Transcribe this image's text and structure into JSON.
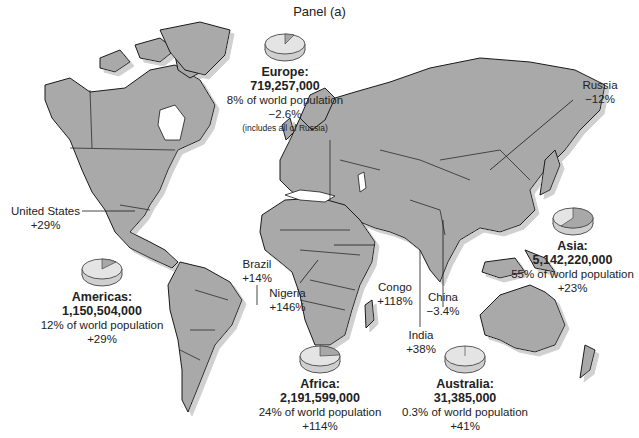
{
  "panel_title": "Panel (a)",
  "colors": {
    "land": "#a9a9a9",
    "border": "#1a1a1a",
    "shadow": "#d8d8d8",
    "water": "#ffffff",
    "pie_top": "#e4e4e4",
    "pie_slice": "#a8a8a8",
    "pie_side": "#cfcfcf"
  },
  "regions": [
    {
      "id": "europe",
      "name": "Europe:",
      "population": "719,257,000",
      "share": "8% of world population",
      "change": "−2.6%",
      "note": "(includes all of Russia)",
      "share_pct": 8
    },
    {
      "id": "asia",
      "name": "Asia:",
      "population": "5,142,220,000",
      "share": "55% of world population",
      "change": "+23%",
      "share_pct": 55
    },
    {
      "id": "americas",
      "name": "Americas:",
      "population": "1,150,504,000",
      "share": "12% of world population",
      "change": "+29%",
      "share_pct": 12
    },
    {
      "id": "africa",
      "name": "Africa:",
      "population": "2,191,599,000",
      "share": "24% of world population",
      "change": "+114%",
      "share_pct": 24
    },
    {
      "id": "australia",
      "name": "Australia:",
      "population": "31,385,000",
      "share": "0.3% of world population",
      "change": "+41%",
      "share_pct": 0.3
    }
  ],
  "countries": [
    {
      "id": "united-states",
      "name": "United States",
      "change": "+29%"
    },
    {
      "id": "russia",
      "name": "Russia",
      "change": "−12%"
    },
    {
      "id": "brazil",
      "name": "Brazil",
      "change": "+14%"
    },
    {
      "id": "nigeria",
      "name": "Nigeria",
      "change": "+146%"
    },
    {
      "id": "congo",
      "name": "Congo",
      "change": "+118%"
    },
    {
      "id": "china",
      "name": "China",
      "change": "−3.4%"
    },
    {
      "id": "india",
      "name": "India",
      "change": "+38%"
    }
  ]
}
